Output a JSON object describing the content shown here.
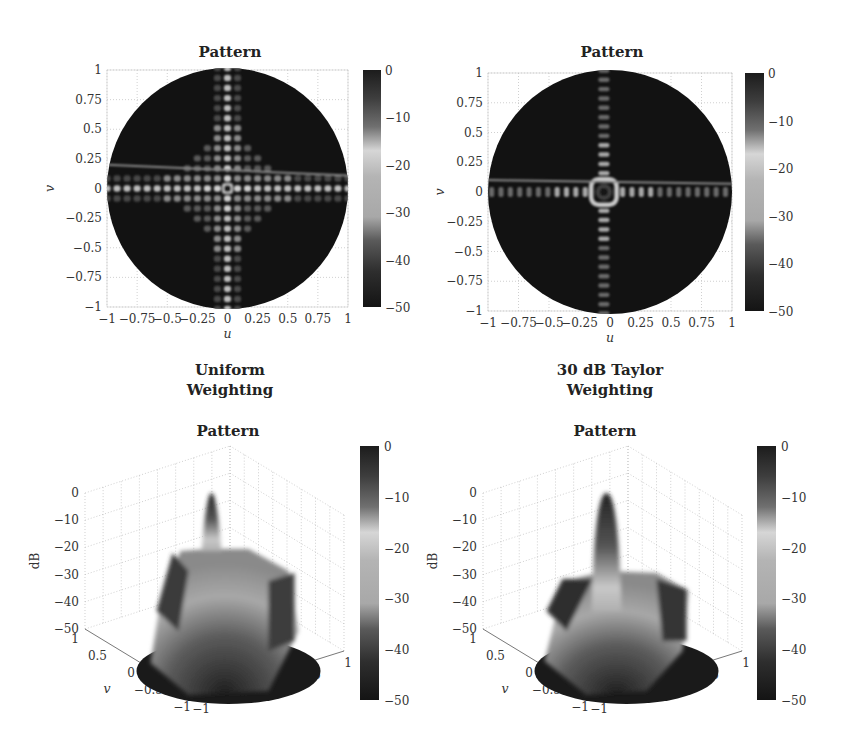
{
  "chart_data": [
    {
      "id": "uniform-2d",
      "type": "heatmap",
      "title": "Pattern",
      "xlabel": "u",
      "ylabel": "v",
      "xlim": [
        -1,
        1
      ],
      "ylim": [
        -1,
        1
      ],
      "xticks": [
        "−1",
        "−0.75",
        "−0.5",
        "−0.25",
        "0",
        "0.25",
        "0.5",
        "0.75",
        "1"
      ],
      "yticks": [
        "−1",
        "−0.75",
        "−0.5",
        "−0.25",
        "0",
        "0.25",
        "0.5",
        "0.75",
        "1"
      ],
      "grid": true,
      "colorbar": {
        "min": -50,
        "max": 0,
        "ticks": [
          "0",
          "−10",
          "−20",
          "−30",
          "−40",
          "−50"
        ],
        "units": "dB"
      },
      "description": "Uniform weighting planar array pattern: strong cross-shaped sidelobe lattice along u=0 and v=0 axes, mainbeam at center, ~-13 dB first sidelobes",
      "peak_sidelobe_db": -13,
      "mainbeam": {
        "u": 0,
        "v": 0
      }
    },
    {
      "id": "taylor-2d",
      "type": "heatmap",
      "title": "Pattern",
      "xlabel": "u",
      "ylabel": "v",
      "xlim": [
        -1,
        1
      ],
      "ylim": [
        -1,
        1
      ],
      "xticks": [
        "−1",
        "−0.75",
        "−0.5",
        "−0.25",
        "0",
        "0.25",
        "0.5",
        "0.75",
        "1"
      ],
      "yticks": [
        "−1",
        "−0.75",
        "−0.5",
        "−0.25",
        "0",
        "0.25",
        "0.5",
        "0.75",
        "1"
      ],
      "grid": true,
      "colorbar": {
        "min": -50,
        "max": 0,
        "ticks": [
          "0",
          "−10",
          "−20",
          "−30",
          "−40",
          "−50"
        ],
        "units": "dB"
      },
      "description": "30 dB Taylor weighting planar array pattern: reduced sidelobes confined to principal cuts, wider mainbeam",
      "peak_sidelobe_db": -30,
      "mainbeam": {
        "u": -0.05,
        "v": 0
      }
    },
    {
      "id": "uniform-3d",
      "type": "surface",
      "title": "Pattern",
      "xlabel": "u",
      "ylabel": "v",
      "zlabel": "dB",
      "xlim": [
        -1,
        1
      ],
      "ylim": [
        -1,
        1
      ],
      "zlim": [
        -50,
        0
      ],
      "xticks": [
        "−1",
        "−0.5",
        "0",
        "0.5",
        "1"
      ],
      "yticks": [
        "−1",
        "−0.5",
        "0",
        "0.5",
        "1"
      ],
      "zticks": [
        "0",
        "−10",
        "−20",
        "−30",
        "−40",
        "−50"
      ],
      "colorbar": {
        "min": -50,
        "max": 0,
        "ticks": [
          "0",
          "−10",
          "−20",
          "−30",
          "−40",
          "−50"
        ]
      },
      "peak_db": 0,
      "sidelobe_plateau_db": -25
    },
    {
      "id": "taylor-3d",
      "type": "surface",
      "title": "Pattern",
      "xlabel": "u",
      "ylabel": "v",
      "zlabel": "dB",
      "xlim": [
        -1,
        1
      ],
      "ylim": [
        -1,
        1
      ],
      "zlim": [
        -50,
        0
      ],
      "xticks": [
        "−1",
        "−0.5",
        "0",
        "0.5",
        "1"
      ],
      "yticks": [
        "−1",
        "−0.5",
        "0",
        "0.5",
        "1"
      ],
      "zticks": [
        "0",
        "−10",
        "−20",
        "−30",
        "−40",
        "−50"
      ],
      "colorbar": {
        "min": -50,
        "max": 0,
        "ticks": [
          "0",
          "−10",
          "−20",
          "−30",
          "−40",
          "−50"
        ]
      },
      "peak_db": 0,
      "sidelobe_plateau_db": -32
    }
  ],
  "captions": {
    "left": [
      "Uniform",
      "Weighting"
    ],
    "right": [
      "30 dB Taylor",
      "Weighting"
    ]
  },
  "colormap": [
    "#151515",
    "#3a3a3a",
    "#6e6e6e",
    "#a8a8a8",
    "#d8d8d8",
    "#b0b0b0",
    "#707070",
    "#3c3c3c",
    "#262626"
  ]
}
